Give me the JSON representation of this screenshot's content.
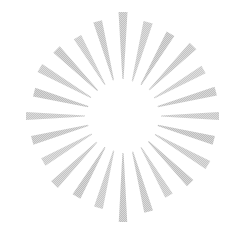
{
  "canvas": {
    "width": 246,
    "height": 232,
    "background_color": "#ffffff",
    "title": "Starburst"
  },
  "graphic": {
    "name": "sunburst-starburst",
    "type": "radial-burst",
    "center_x": 123,
    "center_y": 116,
    "ray_count": 24,
    "inner_radius": 36,
    "outer_radius": 99,
    "ray_outer_width": 9.5,
    "ray_inner_width": 1.2,
    "taper": "wide-outer-to-point-inner",
    "ray_color": "#bdbdbd",
    "ray_color_light": "#d6d6d6",
    "ray_color_dark": "#a9a9a9",
    "texture": "halftone-dither",
    "opacity": 0.92,
    "rays": [
      {
        "angle": 0,
        "outer_radius": 104,
        "inner_radius": 37,
        "width": 9.0,
        "color": "#bcbcbc"
      },
      {
        "angle": 15,
        "outer_radius": 97,
        "inner_radius": 36,
        "width": 9.5,
        "color": "#c2c2c2"
      },
      {
        "angle": 30,
        "outer_radius": 95,
        "inner_radius": 36,
        "width": 9.0,
        "color": "#b9b9b9"
      },
      {
        "angle": 45,
        "outer_radius": 99,
        "inner_radius": 37,
        "width": 9.5,
        "color": "#bebebe"
      },
      {
        "angle": 60,
        "outer_radius": 93,
        "inner_radius": 36,
        "width": 8.5,
        "color": "#c4c4c4"
      },
      {
        "angle": 75,
        "outer_radius": 96,
        "inner_radius": 36,
        "width": 9.0,
        "color": "#bbbbbb"
      },
      {
        "angle": 90,
        "outer_radius": 96,
        "inner_radius": 38,
        "width": 8.0,
        "color": "#c0c0c0"
      },
      {
        "angle": 105,
        "outer_radius": 94,
        "inner_radius": 36,
        "width": 9.0,
        "color": "#b7b7b7"
      },
      {
        "angle": 120,
        "outer_radius": 98,
        "inner_radius": 37,
        "width": 9.5,
        "color": "#c1c1c1"
      },
      {
        "angle": 135,
        "outer_radius": 95,
        "inner_radius": 36,
        "width": 9.0,
        "color": "#bababa"
      },
      {
        "angle": 150,
        "outer_radius": 92,
        "inner_radius": 36,
        "width": 8.5,
        "color": "#c3c3c3"
      },
      {
        "angle": 165,
        "outer_radius": 99,
        "inner_radius": 37,
        "width": 9.0,
        "color": "#bcbcbc"
      },
      {
        "angle": 180,
        "outer_radius": 106,
        "inner_radius": 37,
        "width": 8.5,
        "color": "#b8b8b8"
      },
      {
        "angle": 195,
        "outer_radius": 95,
        "inner_radius": 36,
        "width": 9.0,
        "color": "#c2c2c2"
      },
      {
        "angle": 210,
        "outer_radius": 93,
        "inner_radius": 36,
        "width": 9.0,
        "color": "#b9b9b9"
      },
      {
        "angle": 225,
        "outer_radius": 97,
        "inner_radius": 37,
        "width": 9.5,
        "color": "#bfbfbf"
      },
      {
        "angle": 240,
        "outer_radius": 92,
        "inner_radius": 36,
        "width": 8.5,
        "color": "#c4c4c4"
      },
      {
        "angle": 255,
        "outer_radius": 94,
        "inner_radius": 36,
        "width": 9.0,
        "color": "#bbbbbb"
      },
      {
        "angle": 270,
        "outer_radius": 97,
        "inner_radius": 38,
        "width": 8.0,
        "color": "#c0c0c0"
      },
      {
        "angle": 285,
        "outer_radius": 92,
        "inner_radius": 36,
        "width": 9.0,
        "color": "#b7b7b7"
      },
      {
        "angle": 300,
        "outer_radius": 96,
        "inner_radius": 37,
        "width": 9.5,
        "color": "#c1c1c1"
      },
      {
        "angle": 315,
        "outer_radius": 94,
        "inner_radius": 36,
        "width": 9.0,
        "color": "#bababa"
      },
      {
        "angle": 330,
        "outer_radius": 91,
        "inner_radius": 36,
        "width": 8.5,
        "color": "#c3c3c3"
      },
      {
        "angle": 345,
        "outer_radius": 98,
        "inner_radius": 37,
        "width": 9.0,
        "color": "#bdbdbd"
      }
    ]
  }
}
